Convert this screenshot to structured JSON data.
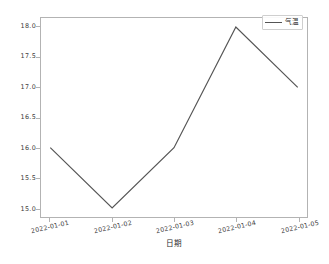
{
  "chart_data": {
    "type": "line",
    "title": "",
    "subtitle": "",
    "xlabel": "日期",
    "ylabel": "",
    "x": [
      "2022-01-01",
      "2022-01-02",
      "2022-01-03",
      "2022-01-04",
      "2022-01-05"
    ],
    "categories": [
      "2022-01-01",
      "2022-01-02",
      "2022-01-03",
      "2022-01-04",
      "2022-01-05"
    ],
    "series": [
      {
        "name": "气温",
        "values": [
          16.0,
          15.0,
          16.0,
          18.0,
          17.0
        ],
        "color": "#555555",
        "marker": "none",
        "linewidth": 1.2
      }
    ],
    "xtick_labels": [
      "2022-01-01",
      "2022-01-02",
      "2022-01-03",
      "2022-01-04",
      "2022-01-05"
    ],
    "ytick_labels": [
      "15.0",
      "15.5",
      "16.0",
      "16.5",
      "17.0",
      "17.5",
      "18.0"
    ],
    "ytick_values": [
      15.0,
      15.5,
      16.0,
      16.5,
      17.0,
      17.5,
      18.0
    ],
    "ylim": [
      14.85,
      18.15
    ],
    "xlim": [
      -0.15,
      4.15
    ],
    "grid": false,
    "legend": {
      "entries": [
        "气温"
      ],
      "position": "upper right",
      "visible": true
    },
    "annotations": [],
    "colors": {
      "line": "#555555",
      "spine": "#b3b3b3",
      "tick_label": "#3b3b3b",
      "axis_label": "#2b2b2b",
      "background": "#ffffff"
    }
  }
}
